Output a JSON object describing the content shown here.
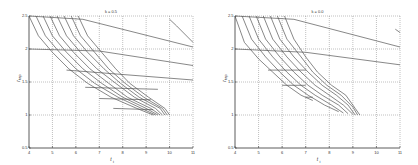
{
  "chart_data": [
    {
      "type": "line",
      "title": "k = 0.5",
      "xlabel": "t_i",
      "ylabel": "r_tap",
      "xlim": [
        4,
        11
      ],
      "ylim": [
        0.5,
        2.5
      ],
      "xticks": [
        4,
        5,
        6,
        7,
        8,
        9,
        10,
        11
      ],
      "yticks": [
        0.5,
        1,
        1.5,
        2,
        2.5
      ],
      "grid": true,
      "legend": null,
      "series": [
        {
          "name": "horizontal-1",
          "x": [
            4.0,
            6.3,
            11.0
          ],
          "y": [
            2.5,
            2.45,
            2.03
          ]
        },
        {
          "name": "horizontal-2",
          "x": [
            4.0,
            7.0,
            11.0
          ],
          "y": [
            2.0,
            1.97,
            1.75
          ]
        },
        {
          "name": "horizontal-3",
          "x": [
            5.6,
            11.0
          ],
          "y": [
            1.68,
            1.53
          ]
        },
        {
          "name": "horizontal-4",
          "x": [
            6.4,
            9.5
          ],
          "y": [
            1.42,
            1.39
          ]
        },
        {
          "name": "horizontal-5",
          "x": [
            7.0,
            9.2
          ],
          "y": [
            1.25,
            1.23
          ]
        },
        {
          "name": "horizontal-6",
          "x": [
            7.6,
            9.3
          ],
          "y": [
            1.1,
            1.08
          ]
        },
        {
          "name": "edge-curve",
          "x": [
            10.0,
            10.3,
            11.0
          ],
          "y": [
            2.45,
            2.35,
            2.1
          ]
        },
        {
          "name": "c1",
          "x": [
            4.0,
            4.4,
            5.0,
            5.7,
            6.5,
            7.5,
            8.6,
            9.3
          ],
          "y": [
            2.5,
            2.2,
            1.95,
            1.7,
            1.48,
            1.27,
            1.1,
            1.0
          ]
        },
        {
          "name": "c2",
          "x": [
            4.3,
            4.7,
            5.3,
            6.0,
            6.8,
            7.8,
            8.8,
            9.4
          ],
          "y": [
            2.5,
            2.2,
            1.95,
            1.7,
            1.48,
            1.27,
            1.1,
            1.0
          ]
        },
        {
          "name": "c3",
          "x": [
            4.6,
            5.0,
            5.6,
            6.3,
            7.1,
            8.0,
            9.0,
            9.5
          ],
          "y": [
            2.5,
            2.2,
            1.95,
            1.7,
            1.48,
            1.27,
            1.1,
            1.0
          ]
        },
        {
          "name": "c4",
          "x": [
            4.9,
            5.3,
            5.9,
            6.6,
            7.4,
            8.2,
            9.2,
            9.6
          ],
          "y": [
            2.5,
            2.2,
            1.95,
            1.7,
            1.48,
            1.27,
            1.1,
            1.0
          ]
        },
        {
          "name": "c5",
          "x": [
            5.2,
            5.6,
            6.2,
            6.9,
            7.7,
            8.5,
            9.4,
            9.7
          ],
          "y": [
            2.5,
            2.2,
            1.95,
            1.7,
            1.48,
            1.27,
            1.1,
            1.0
          ]
        },
        {
          "name": "c6",
          "x": [
            5.5,
            5.9,
            6.5,
            7.2,
            7.9,
            8.7,
            9.6,
            9.8
          ],
          "y": [
            2.5,
            2.2,
            1.95,
            1.7,
            1.48,
            1.27,
            1.1,
            1.0
          ]
        },
        {
          "name": "c7",
          "x": [
            5.8,
            6.2,
            6.8,
            7.4,
            8.1,
            8.9,
            9.7,
            9.9
          ],
          "y": [
            2.5,
            2.2,
            1.95,
            1.7,
            1.48,
            1.27,
            1.1,
            1.0
          ]
        },
        {
          "name": "c8",
          "x": [
            6.1,
            6.5,
            7.1,
            7.7,
            8.3,
            9.1,
            9.8,
            10.0
          ],
          "y": [
            2.5,
            2.2,
            1.95,
            1.7,
            1.48,
            1.27,
            1.1,
            1.0
          ]
        }
      ]
    },
    {
      "type": "line",
      "title": "k = 0.0",
      "xlabel": "t_i",
      "ylabel": "r_tap",
      "xlim": [
        4,
        11
      ],
      "ylim": [
        0.5,
        2.5
      ],
      "xticks": [
        4,
        5,
        6,
        7,
        8,
        9,
        10,
        11
      ],
      "yticks": [
        0.5,
        1,
        1.5,
        2,
        2.5
      ],
      "grid": true,
      "legend": null,
      "series": [
        {
          "name": "horizontal-1",
          "x": [
            4.0,
            6.5,
            11.0
          ],
          "y": [
            2.5,
            2.45,
            2.03
          ]
        },
        {
          "name": "horizontal-2",
          "x": [
            4.0,
            7.0,
            11.0
          ],
          "y": [
            2.0,
            1.95,
            1.76
          ]
        },
        {
          "name": "horizontal-3",
          "x": [
            5.4,
            7.0
          ],
          "y": [
            1.68,
            1.68
          ]
        },
        {
          "name": "horizontal-4",
          "x": [
            6.0,
            7.0
          ],
          "y": [
            1.45,
            1.45
          ]
        },
        {
          "name": "horizontal-5",
          "x": [
            7.0,
            7.3
          ],
          "y": [
            1.27,
            1.27
          ]
        },
        {
          "name": "edge-curve",
          "x": [
            10.8,
            11.0
          ],
          "y": [
            2.3,
            2.25
          ]
        },
        {
          "name": "c1",
          "x": [
            4.0,
            4.4,
            5.0,
            5.6,
            6.2,
            6.8,
            7.3
          ],
          "y": [
            2.5,
            2.1,
            1.85,
            1.65,
            1.45,
            1.3,
            1.22
          ]
        },
        {
          "name": "c2",
          "x": [
            4.3,
            4.7,
            5.3,
            5.9,
            6.5,
            7.1,
            7.8,
            8.4
          ],
          "y": [
            2.5,
            2.15,
            1.88,
            1.65,
            1.45,
            1.3,
            1.15,
            1.05
          ]
        },
        {
          "name": "c3",
          "x": [
            4.6,
            5.0,
            5.6,
            6.2,
            6.8,
            7.4,
            8.1,
            8.6
          ],
          "y": [
            2.5,
            2.15,
            1.88,
            1.65,
            1.45,
            1.3,
            1.15,
            1.03
          ]
        },
        {
          "name": "c4",
          "x": [
            4.9,
            5.3,
            5.9,
            6.5,
            7.1,
            7.7,
            8.4,
            8.8
          ],
          "y": [
            2.5,
            2.15,
            1.88,
            1.65,
            1.45,
            1.3,
            1.15,
            1.02
          ]
        },
        {
          "name": "c5",
          "x": [
            5.2,
            5.6,
            6.2,
            6.8,
            7.4,
            8.0,
            8.6,
            9.0
          ],
          "y": [
            2.5,
            2.15,
            1.88,
            1.65,
            1.45,
            1.3,
            1.15,
            1.01
          ]
        },
        {
          "name": "c6",
          "x": [
            5.5,
            5.9,
            6.5,
            7.1,
            7.7,
            8.3,
            8.8,
            9.1
          ],
          "y": [
            2.5,
            2.15,
            1.88,
            1.65,
            1.45,
            1.3,
            1.15,
            1.0
          ]
        },
        {
          "name": "c7",
          "x": [
            5.8,
            6.2,
            6.8,
            7.3,
            7.9,
            8.5,
            9.0,
            9.2
          ],
          "y": [
            2.5,
            2.15,
            1.88,
            1.65,
            1.45,
            1.3,
            1.12,
            1.0
          ]
        },
        {
          "name": "c8",
          "x": [
            6.1,
            6.5,
            7.0,
            7.5,
            8.1,
            8.7,
            9.1,
            9.3
          ],
          "y": [
            2.5,
            2.15,
            1.88,
            1.65,
            1.45,
            1.3,
            1.1,
            1.0
          ]
        }
      ]
    }
  ],
  "panels": [
    {
      "title": "k = 0.5",
      "xlabel": "t",
      "xlabel_sub": "i",
      "ylabel": "r",
      "ylabel_sub": "tap"
    },
    {
      "title": "k = 0.0",
      "xlabel": "t",
      "xlabel_sub": "i",
      "ylabel": "r",
      "ylabel_sub": "tap"
    }
  ],
  "style": {
    "line_color": "#555555",
    "grid_color": "#7a7a7a",
    "axis_color": "#333333"
  }
}
